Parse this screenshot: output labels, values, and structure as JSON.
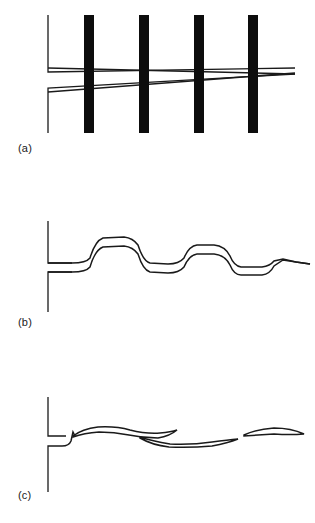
{
  "figure": {
    "width": 315,
    "height": 523,
    "background": "#ffffff",
    "ink_color": "#111111",
    "bar_color": "#0d0d0d",
    "trace_color": "#1a1a1a"
  },
  "panels": [
    {
      "id": "a",
      "label": "(a)",
      "description": "four thick vertical black bars with two converging diagonal traces and an L-shaped bracket axis",
      "axis": {
        "x": 48,
        "top_segment": {
          "y_start": 15,
          "y_end": 72,
          "tick_x_end": 295
        },
        "bottom_segment": {
          "y_start": 88,
          "y_end": 133,
          "tick_x_end": 295
        }
      },
      "bars": [
        {
          "x": 84,
          "y": 15,
          "width": 10,
          "height": 118
        },
        {
          "x": 139,
          "y": 15,
          "width": 10,
          "height": 118
        },
        {
          "x": 194,
          "y": 15,
          "width": 10,
          "height": 118
        },
        {
          "x": 248,
          "y": 15,
          "width": 10,
          "height": 118
        }
      ],
      "bar_count": 4,
      "traces": [
        {
          "name": "upper-diagonal",
          "x1": 48,
          "y1": 68,
          "x2": 295,
          "y2": 74
        },
        {
          "name": "lower-diagonal",
          "x1": 48,
          "y1": 92,
          "x2": 295,
          "y2": 73
        }
      ],
      "convergence_point": {
        "x": 295,
        "y": 73
      }
    },
    {
      "id": "b",
      "label": "(b)",
      "description": "two overlapping rounded step waveforms that converge at the right end",
      "axis": {
        "x": 48,
        "top_segment": {
          "y_start": 221,
          "y_end": 263,
          "tick_x_end": 72
        },
        "bottom_segment": {
          "y_start": 272,
          "y_end": 312,
          "tick_x_end": 72
        }
      },
      "traces": [
        {
          "name": "upper-step-trace",
          "points": [
            [
              48,
              263
            ],
            [
              72,
              263
            ],
            [
              82,
              262
            ],
            [
              88,
              261
            ],
            [
              92,
              256
            ],
            [
              96,
              243
            ],
            [
              101,
              238
            ],
            [
              110,
              237
            ],
            [
              124,
              237
            ],
            [
              134,
              238
            ],
            [
              139,
              243
            ],
            [
              143,
              256
            ],
            [
              147,
              262
            ],
            [
              152,
              263
            ],
            [
              168,
              264
            ],
            [
              178,
              264
            ],
            [
              183,
              261
            ],
            [
              187,
              251
            ],
            [
              192,
              246
            ],
            [
              200,
              245
            ],
            [
              214,
              245
            ],
            [
              224,
              246
            ],
            [
              229,
              251
            ],
            [
              233,
              261
            ],
            [
              238,
              266
            ],
            [
              250,
              267
            ],
            [
              262,
              267
            ],
            [
              268,
              265
            ],
            [
              273,
              261
            ],
            [
              281,
              259
            ],
            [
              292,
              261
            ],
            [
              300,
              263
            ],
            [
              310,
              264
            ]
          ]
        },
        {
          "name": "lower-step-trace",
          "points": [
            [
              48,
              272
            ],
            [
              72,
              272
            ],
            [
              82,
              271
            ],
            [
              88,
              270
            ],
            [
              92,
              265
            ],
            [
              96,
              252
            ],
            [
              101,
              247
            ],
            [
              110,
              246
            ],
            [
              124,
              246
            ],
            [
              134,
              247
            ],
            [
              139,
              252
            ],
            [
              143,
              265
            ],
            [
              147,
              271
            ],
            [
              152,
              272
            ],
            [
              168,
              273
            ],
            [
              178,
              273
            ],
            [
              183,
              270
            ],
            [
              187,
              260
            ],
            [
              192,
              255
            ],
            [
              200,
              254
            ],
            [
              214,
              254
            ],
            [
              224,
              255
            ],
            [
              229,
              260
            ],
            [
              233,
              270
            ],
            [
              238,
              274
            ],
            [
              250,
              275
            ],
            [
              262,
              275
            ],
            [
              268,
              272
            ],
            [
              273,
              264
            ],
            [
              281,
              260
            ],
            [
              292,
              261
            ],
            [
              300,
              263
            ],
            [
              310,
              264
            ]
          ]
        }
      ],
      "step_count": 2,
      "converges_at_right": true
    },
    {
      "id": "c",
      "label": "(c)",
      "description": "difference signal showing a sharp spike at the origin followed by three thin lens-shaped loops near the baseline",
      "axis": {
        "x": 48,
        "top_segment": {
          "y_start": 397,
          "y_end": 436,
          "tick_x_end": 68
        },
        "bottom_segment": {
          "y_start": 444,
          "y_end": 492,
          "tick_x_end": 68
        }
      },
      "spike": {
        "x": 72,
        "y_top": 432,
        "y_bottom": 445,
        "sharp": true
      },
      "loops": [
        {
          "name": "loop-1",
          "upper": [
            [
              72,
              436
            ],
            [
              82,
              430
            ],
            [
              96,
              427
            ],
            [
              112,
              427
            ],
            [
              128,
              430
            ],
            [
              142,
              433
            ],
            [
              156,
              433
            ],
            [
              168,
              431
            ],
            [
              176,
              430
            ]
          ],
          "lower": [
            [
              72,
              437
            ],
            [
              84,
              434
            ],
            [
              98,
              432
            ],
            [
              114,
              432
            ],
            [
              130,
              435
            ],
            [
              144,
              437
            ],
            [
              158,
              437
            ],
            [
              170,
              435
            ],
            [
              176,
              430
            ]
          ]
        },
        {
          "name": "loop-2",
          "upper": [
            [
              140,
              437
            ],
            [
              152,
              441
            ],
            [
              168,
              444
            ],
            [
              188,
              444
            ],
            [
              210,
              442
            ],
            [
              228,
              440
            ],
            [
              238,
              439
            ]
          ],
          "lower": [
            [
              140,
              438
            ],
            [
              154,
              444
            ],
            [
              170,
              447
            ],
            [
              190,
              447
            ],
            [
              212,
              445
            ],
            [
              230,
              442
            ],
            [
              238,
              439
            ]
          ]
        },
        {
          "name": "loop-3",
          "upper": [
            [
              244,
              434
            ],
            [
              256,
              430
            ],
            [
              272,
              428
            ],
            [
              288,
              429
            ],
            [
              298,
              432
            ],
            [
              304,
              434
            ]
          ],
          "lower": [
            [
              244,
              435
            ],
            [
              258,
              434
            ],
            [
              274,
              433
            ],
            [
              290,
              433
            ],
            [
              300,
              434
            ],
            [
              304,
              434
            ]
          ]
        }
      ],
      "loop_count": 3
    }
  ]
}
